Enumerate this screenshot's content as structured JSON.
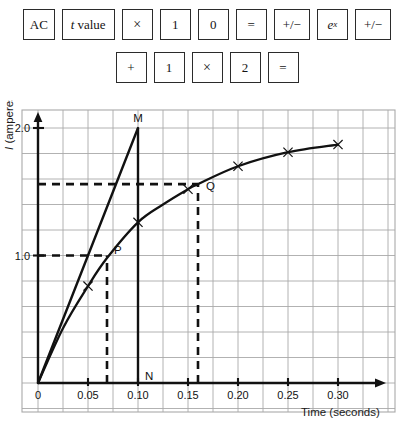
{
  "keystrokes": {
    "row1": [
      {
        "name": "key-ac",
        "label": "AC",
        "kind": "text"
      },
      {
        "name": "key-t-value",
        "label": "t value",
        "kind": "italic-first"
      },
      {
        "name": "key-times-1",
        "label": "×",
        "kind": "times"
      },
      {
        "name": "key-one-1",
        "label": "1",
        "kind": "text"
      },
      {
        "name": "key-zero",
        "label": "0",
        "kind": "text"
      },
      {
        "name": "key-equals-1",
        "label": "=",
        "kind": "text"
      },
      {
        "name": "key-plusminus-1",
        "label": "+/−",
        "kind": "text"
      },
      {
        "name": "key-exp",
        "label": "e^x",
        "kind": "superscript",
        "base": "e",
        "sup": "x"
      },
      {
        "name": "key-plusminus-2",
        "label": "+/−",
        "kind": "text"
      }
    ],
    "row2": [
      {
        "name": "key-plus",
        "label": "+",
        "kind": "text"
      },
      {
        "name": "key-one-2",
        "label": "1",
        "kind": "text"
      },
      {
        "name": "key-times-2",
        "label": "×",
        "kind": "times"
      },
      {
        "name": "key-two",
        "label": "2",
        "kind": "text"
      },
      {
        "name": "key-equals-2",
        "label": "=",
        "kind": "text"
      }
    ]
  },
  "chart_data": {
    "type": "line",
    "title": "",
    "xlabel": "Time (seconds)",
    "ylabel": "I (amperes)",
    "xlim": [
      0,
      0.335
    ],
    "ylim": [
      0,
      2.12
    ],
    "grid": true,
    "grid_x_step": 0.025,
    "grid_y_step": 0.2,
    "xticks": [
      "0",
      "0.05",
      "0.10",
      "0.15",
      "0.20",
      "0.25",
      "0.30"
    ],
    "xtick_values": [
      0,
      0.05,
      0.1,
      0.15,
      0.2,
      0.25,
      0.3
    ],
    "yticks": [
      "1.0",
      "2.0"
    ],
    "ytick_values": [
      1.0,
      2.0
    ],
    "legend": "none",
    "series": [
      {
        "name": "current-curve",
        "style": "solid-curve-with-x-markers",
        "x": [
          0.0,
          0.025,
          0.05,
          0.069,
          0.1,
          0.125,
          0.15,
          0.16,
          0.2,
          0.25,
          0.3
        ],
        "y": [
          0.0,
          0.43,
          0.76,
          0.98,
          1.26,
          1.4,
          1.52,
          1.56,
          1.7,
          1.81,
          1.87
        ],
        "markers_x": [
          0.05,
          0.1,
          0.15,
          0.2,
          0.25,
          0.3
        ],
        "markers_y": [
          0.76,
          1.26,
          1.52,
          1.7,
          1.81,
          1.87
        ]
      },
      {
        "name": "tangent-line",
        "style": "solid-straight",
        "x": [
          0.0,
          0.1
        ],
        "y": [
          0.0,
          2.0
        ]
      }
    ],
    "annotations": [
      {
        "name": "point-M",
        "label": "M",
        "x": 0.1,
        "y": 2.0
      },
      {
        "name": "point-N",
        "label": "N",
        "x": 0.1,
        "y": 0.0
      },
      {
        "name": "point-P",
        "label": "P",
        "x": 0.069,
        "y": 1.0
      },
      {
        "name": "point-Q",
        "label": "Q",
        "x": 0.16,
        "y": 1.56
      }
    ],
    "guides": [
      {
        "name": "guide-h-1a",
        "orientation": "horizontal",
        "value": 1.0,
        "from": 0.0,
        "to": 0.069,
        "style": "dashed"
      },
      {
        "name": "guide-v-p",
        "orientation": "vertical",
        "value": 0.069,
        "from": 0.0,
        "to": 1.0,
        "style": "dashed"
      },
      {
        "name": "guide-h-q",
        "orientation": "horizontal",
        "value": 1.56,
        "from": 0.0,
        "to": 0.16,
        "style": "dashed"
      },
      {
        "name": "guide-v-q",
        "orientation": "vertical",
        "value": 0.16,
        "from": 0.0,
        "to": 1.56,
        "style": "dashed"
      },
      {
        "name": "segment-MN",
        "orientation": "vertical",
        "value": 0.1,
        "from": 0.0,
        "to": 2.0,
        "style": "solid"
      }
    ],
    "colors": {
      "grid": "#a9a9a9",
      "axis": "#111111",
      "curve": "#111111",
      "tangent": "#111111",
      "dashed": "#111111"
    }
  }
}
